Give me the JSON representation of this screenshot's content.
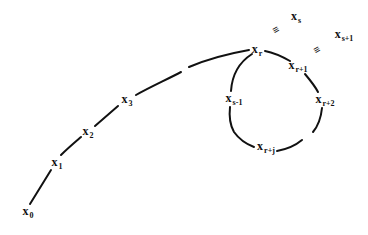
{
  "diagram": {
    "type": "rho-shaped sequence diagram",
    "stroke_color": "#111111",
    "background": "#ffffff",
    "nodes": [
      {
        "id": "x0",
        "base": "x",
        "sub": "0",
        "x": 28,
        "y": 212
      },
      {
        "id": "x1",
        "base": "x",
        "sub": "1",
        "x": 57,
        "y": 163
      },
      {
        "id": "x2",
        "base": "x",
        "sub": "2",
        "x": 88,
        "y": 132
      },
      {
        "id": "x3",
        "base": "x",
        "sub": "3",
        "x": 127,
        "y": 100
      },
      {
        "id": "xr",
        "base": "x",
        "sub": "r",
        "x": 257,
        "y": 50
      },
      {
        "id": "xr1",
        "base": "x",
        "sub": "r+1",
        "x": 298,
        "y": 66
      },
      {
        "id": "xr2",
        "base": "x",
        "sub": "r+2",
        "x": 325,
        "y": 100
      },
      {
        "id": "xrj",
        "base": "x",
        "sub": "r+j",
        "x": 266,
        "y": 147
      },
      {
        "id": "xs1m",
        "base": "x",
        "sub": "s-1",
        "x": 234,
        "y": 99
      },
      {
        "id": "xs",
        "base": "x",
        "sub": "s",
        "x": 296,
        "y": 17
      },
      {
        "id": "xsp1",
        "base": "x",
        "sub": "s+1",
        "x": 344,
        "y": 35
      }
    ],
    "equivalences": [
      {
        "symbol": "≡",
        "between": [
          "xs",
          "xr"
        ],
        "x": 276,
        "y": 30
      },
      {
        "symbol": "≡",
        "between": [
          "xsp1",
          "xr1"
        ],
        "x": 317,
        "y": 50
      }
    ],
    "tail_segments": [
      "M 30 204 L 51 170",
      "M 61 155 C 68 148, 74 143, 81 137",
      "M 95 126 L 118 106",
      "M 136 95 C 150 87, 168 79, 181 72",
      "M 189 67 C 210 58, 232 53, 249 50"
    ],
    "cycle_segments": [
      "M 265 51 C 275 53, 283 57, 290 61",
      "M 305 74 C 310 80, 315 86, 318 92",
      "M 322 108 C 321 118, 318 126, 313 132",
      "M 302 140 C 296 145, 288 149, 277 151",
      "M 254 147 C 246 144, 239 139, 234 132 C 230 125, 229 116, 230 107",
      "M 231 91 C 232 76, 238 63, 252 54"
    ]
  }
}
